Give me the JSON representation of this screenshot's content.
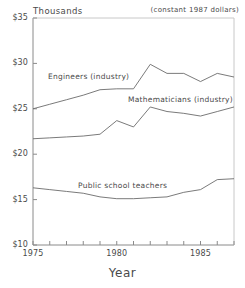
{
  "chart_data": {
    "type": "line",
    "title": "",
    "xlabel": "Year",
    "ylabel": "Thousands",
    "annotation": "(constant 1987 dollars)",
    "xlim": [
      1975,
      1987
    ],
    "ylim": [
      10,
      35
    ],
    "grid": false,
    "legend_position": "inline-labels",
    "ytick_labels": [
      "$35",
      "$30",
      "$25",
      "$20",
      "$15",
      "$10"
    ],
    "ytick_values": [
      35,
      30,
      25,
      20,
      15,
      10
    ],
    "xtick_labels": [
      "1975",
      "1980",
      "1985"
    ],
    "xtick_values": [
      1975,
      1980,
      1985
    ],
    "x": [
      1975,
      1976,
      1977,
      1978,
      1979,
      1980,
      1981,
      1982,
      1983,
      1984,
      1985,
      1986,
      1987
    ],
    "series": [
      {
        "name": "Engineers (industry)",
        "values": [
          25.0,
          25.5,
          26.0,
          26.5,
          27.1,
          27.2,
          27.2,
          29.9,
          28.9,
          28.9,
          28.0,
          28.9,
          28.5
        ]
      },
      {
        "name": "Mathematicians (industry)",
        "values": [
          21.7,
          21.8,
          21.9,
          22.0,
          22.2,
          23.7,
          23.0,
          25.2,
          24.7,
          24.5,
          24.2,
          24.7,
          25.2
        ]
      },
      {
        "name": "Public school teachers",
        "values": [
          16.3,
          16.1,
          15.9,
          15.7,
          15.3,
          15.1,
          15.1,
          15.2,
          15.3,
          15.8,
          16.1,
          17.2,
          17.3
        ]
      }
    ]
  },
  "axes": {
    "ytitle": "Thousands",
    "xtitle": "Year",
    "note": "(constant 1987 dollars)",
    "yticks": [
      {
        "label": "$35",
        "value": 35
      },
      {
        "label": "$30",
        "value": 30
      },
      {
        "label": "$25",
        "value": 25
      },
      {
        "label": "$20",
        "value": 20
      },
      {
        "label": "$15",
        "value": 15
      },
      {
        "label": "$10",
        "value": 10
      }
    ],
    "xticks": [
      {
        "label": "1975",
        "value": 1975
      },
      {
        "label": "1980",
        "value": 1980
      },
      {
        "label": "1985",
        "value": 1985
      }
    ]
  },
  "series_labels": {
    "engineers": "Engineers (industry)",
    "mathematicians": "Mathematicians (industry)",
    "teachers": "Public school teachers"
  },
  "colors": {
    "line": "#6b6b6b",
    "axis": "#808080",
    "text": "#4a4a4a",
    "background": "#ffffff"
  }
}
